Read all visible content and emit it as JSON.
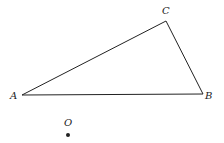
{
  "diagram": {
    "type": "triangle-with-point",
    "vertices": [
      {
        "label": "A",
        "x": 22,
        "y": 95,
        "label_x": 10,
        "label_y": 99
      },
      {
        "label": "B",
        "x": 203,
        "y": 94,
        "label_x": 205,
        "label_y": 99
      },
      {
        "label": "C",
        "x": 166,
        "y": 21,
        "label_x": 162,
        "label_y": 14
      }
    ],
    "point": {
      "label": "O",
      "x": 68,
      "y": 135,
      "label_x": 64,
      "label_y": 126
    },
    "edges": [
      [
        "A",
        "B"
      ],
      [
        "B",
        "C"
      ],
      [
        "C",
        "A"
      ]
    ],
    "colors": {
      "line": "#222222",
      "background": "#ffffff"
    }
  }
}
